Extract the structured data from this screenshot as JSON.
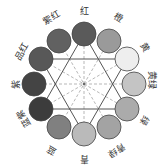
{
  "diagram": {
    "type": "twelve-hue color wheel",
    "center": [
      84,
      84
    ],
    "circle_radius": 12,
    "ring_radius": 48,
    "hues": [
      {
        "label": "红",
        "cx": 84,
        "cy": 34,
        "fill": "#5a5a5a",
        "lx": 84,
        "ly": 11,
        "rot": 0
      },
      {
        "label": "橙",
        "cx": 109,
        "cy": 41,
        "fill": "#9a9a9a",
        "lx": 118,
        "ly": 18,
        "rot": 30
      },
      {
        "label": "黄",
        "cx": 127,
        "cy": 59,
        "fill": "#eeeeee",
        "lx": 144,
        "ly": 48,
        "rot": 60
      },
      {
        "label": "黄绿",
        "cx": 134,
        "cy": 84,
        "fill": "#c4c4c4",
        "lx": 151,
        "ly": 80,
        "rot": 90
      },
      {
        "label": "绿",
        "cx": 127,
        "cy": 109,
        "fill": "#ababab",
        "lx": 144,
        "ly": 120,
        "rot": 120
      },
      {
        "label": "青绿",
        "cx": 109,
        "cy": 127,
        "fill": "#a3a3a3",
        "lx": 116,
        "ly": 150,
        "rot": 150
      },
      {
        "label": "青",
        "cx": 84,
        "cy": 134,
        "fill": "#bababa",
        "lx": 84,
        "ly": 158,
        "rot": 180
      },
      {
        "label": "蓝",
        "cx": 59,
        "cy": 127,
        "fill": "#808080",
        "lx": 52,
        "ly": 150,
        "rot": 210
      },
      {
        "label": "蓝紫",
        "cx": 41,
        "cy": 109,
        "fill": "#3c3c3c",
        "lx": 24,
        "ly": 118,
        "rot": 240
      },
      {
        "label": "紫",
        "cx": 34,
        "cy": 84,
        "fill": "#444444",
        "lx": 16,
        "ly": 84,
        "rot": 270
      },
      {
        "label": "品红",
        "cx": 41,
        "cy": 59,
        "fill": "#585858",
        "lx": 22,
        "ly": 52,
        "rot": 300
      },
      {
        "label": "紫红",
        "cx": 59,
        "cy": 41,
        "fill": "#616161",
        "lx": 52,
        "ly": 18,
        "rot": 330
      }
    ],
    "triangles": [
      {
        "name": "primary-triangle",
        "points": "84,34 127,109 41,109"
      },
      {
        "name": "secondary-triangle",
        "points": "84,134 41,59 127,59"
      }
    ],
    "line_color": "#555555",
    "dash_color": "#999999"
  }
}
